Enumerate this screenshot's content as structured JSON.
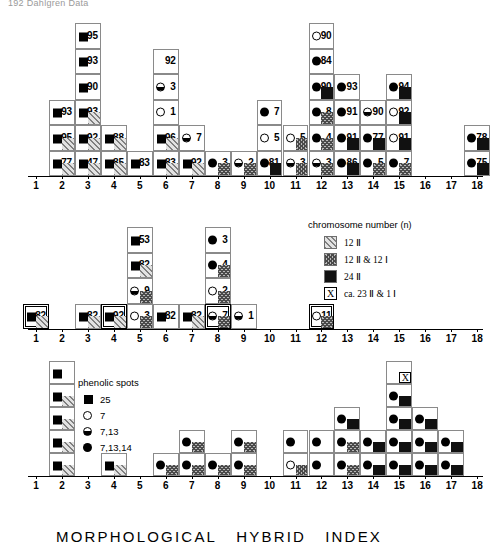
{
  "page": {
    "header": "192  Dahlgren Data"
  },
  "axis": {
    "ticks": [
      1,
      2,
      3,
      4,
      5,
      6,
      7,
      8,
      9,
      10,
      11,
      12,
      13,
      14,
      15,
      16,
      17,
      18
    ],
    "title_parts": [
      "MORPHOLOGICAL",
      "HYBRID",
      "INDEX"
    ]
  },
  "legends": {
    "chromosome": {
      "title": "chromosome   number",
      "title_suffix": "(n)",
      "items": [
        {
          "pattern": "12ii",
          "label": "12 Ⅱ"
        },
        {
          "pattern": "12ii12i",
          "label": "12 Ⅱ & 12 Ⅰ"
        },
        {
          "pattern": "24ii",
          "label": "24 Ⅱ"
        },
        {
          "pattern": "xbox",
          "glyph": "X",
          "label": "ca. 23 Ⅱ & 1 Ⅰ"
        }
      ]
    },
    "phenolic": {
      "title": "phenolic   spots",
      "items": [
        {
          "glyph": "sq",
          "label": "25"
        },
        {
          "glyph": "open",
          "label": "7"
        },
        {
          "glyph": "half",
          "label": "7,13"
        },
        {
          "glyph": "full",
          "label": "7,13,14"
        }
      ]
    }
  },
  "chart_data": [
    {
      "id": "panel-top",
      "type": "bar",
      "title": "",
      "xlabel": "MORPHOLOGICAL HYBRID INDEX",
      "ylabel": "",
      "xlim": [
        1,
        18
      ],
      "grid": false,
      "note": "stacked cell histogram; each cell = one plant, labelled with an accession number, a phenolic-spot glyph and an optional chromosome-number fill patch",
      "categories": [
        1,
        2,
        3,
        4,
        5,
        6,
        7,
        8,
        9,
        10,
        11,
        12,
        13,
        14,
        15,
        16,
        17,
        18
      ],
      "values": [
        0,
        5,
        6,
        2,
        1,
        3,
        2,
        2,
        1,
        2,
        2,
        6,
        4,
        3,
        5,
        0,
        0,
        2
      ],
      "columns": [
        {
          "x": 1,
          "cells": []
        },
        {
          "x": 2,
          "cells": [
            {
              "num": "77",
              "glyph": "sq",
              "chrom": "12ii"
            },
            {
              "num": "95",
              "glyph": "sq",
              "chrom": "12ii"
            },
            {
              "num": "93",
              "glyph": "sq",
              "chrom": ""
            }
          ]
        },
        {
          "x": 3,
          "cells": [
            {
              "num": "47",
              "glyph": "sq",
              "chrom": "12ii"
            },
            {
              "num": "92",
              "glyph": "sq",
              "chrom": "12ii"
            },
            {
              "num": "93",
              "glyph": "sq",
              "chrom": "12ii"
            },
            {
              "num": "90",
              "glyph": "sq",
              "chrom": ""
            },
            {
              "num": "93",
              "glyph": "sq",
              "chrom": ""
            },
            {
              "num": "95",
              "glyph": "sq",
              "chrom": ""
            }
          ]
        },
        {
          "x": 4,
          "cells": [
            {
              "num": "85",
              "glyph": "sq",
              "chrom": "12ii"
            },
            {
              "num": "88",
              "glyph": "sq",
              "chrom": "12ii"
            }
          ]
        },
        {
          "x": 5,
          "cells": [
            {
              "num": "83",
              "glyph": "sq",
              "chrom": ""
            }
          ]
        },
        {
          "x": 6,
          "cells": [
            {
              "num": "83",
              "glyph": "sq",
              "chrom": "12ii"
            },
            {
              "num": "96",
              "glyph": "sq",
              "chrom": "12ii"
            },
            {
              "num": "1",
              "glyph": "open",
              "chrom": ""
            },
            {
              "num": "3",
              "glyph": "half",
              "chrom": ""
            },
            {
              "num": "92",
              "glyph": "",
              "chrom": ""
            }
          ]
        },
        {
          "x": 7,
          "cells": [
            {
              "num": "92",
              "glyph": "sq",
              "chrom": "12ii"
            },
            {
              "num": "7",
              "glyph": "half",
              "chrom": ""
            }
          ]
        },
        {
          "x": 8,
          "cells": [
            {
              "num": "3",
              "glyph": "full",
              "chrom": "12ii12i"
            }
          ]
        },
        {
          "x": 9,
          "cells": [
            {
              "num": "2",
              "glyph": "half",
              "chrom": "12ii12i"
            }
          ]
        },
        {
          "x": 10,
          "cells": [
            {
              "num": "81",
              "glyph": "full",
              "chrom": "24ii"
            },
            {
              "num": "5",
              "glyph": "open",
              "chrom": ""
            },
            {
              "num": "7",
              "glyph": "full",
              "chrom": ""
            }
          ]
        },
        {
          "x": 11,
          "cells": [
            {
              "num": "3",
              "glyph": "half",
              "chrom": "12ii12i"
            },
            {
              "num": "5",
              "glyph": "open",
              "chrom": "12ii12i"
            }
          ]
        },
        {
          "x": 12,
          "cells": [
            {
              "num": "3",
              "glyph": "half",
              "chrom": "12ii12i"
            },
            {
              "num": "4",
              "glyph": "full",
              "chrom": "12ii12i"
            },
            {
              "num": "8",
              "glyph": "full",
              "chrom": "12ii12i"
            },
            {
              "num": "90",
              "glyph": "full",
              "chrom": "24ii"
            },
            {
              "num": "84",
              "glyph": "full",
              "chrom": ""
            },
            {
              "num": "90",
              "glyph": "open",
              "chrom": ""
            }
          ]
        },
        {
          "x": 13,
          "cells": [
            {
              "num": "86",
              "glyph": "full",
              "chrom": "24ii"
            },
            {
              "num": "91",
              "glyph": "full",
              "chrom": "24ii"
            },
            {
              "num": "91",
              "glyph": "full",
              "chrom": ""
            },
            {
              "num": "93",
              "glyph": "full",
              "chrom": ""
            }
          ]
        },
        {
          "x": 14,
          "cells": [
            {
              "num": "5",
              "glyph": "full",
              "chrom": "12ii12i"
            },
            {
              "num": "77",
              "glyph": "full",
              "chrom": "24ii"
            },
            {
              "num": "90",
              "glyph": "half",
              "chrom": ""
            }
          ]
        },
        {
          "x": 15,
          "cells": [
            {
              "num": "7",
              "glyph": "full",
              "chrom": "12ii12i"
            },
            {
              "num": "91",
              "glyph": "open",
              "chrom": "24ii"
            },
            {
              "num": "92",
              "glyph": "open",
              "chrom": "24ii"
            },
            {
              "num": "94",
              "glyph": "full",
              "chrom": "24ii"
            }
          ]
        },
        {
          "x": 16,
          "cells": []
        },
        {
          "x": 17,
          "cells": []
        },
        {
          "x": 18,
          "cells": [
            {
              "num": "75",
              "glyph": "full",
              "chrom": "24ii"
            },
            {
              "num": "78",
              "glyph": "full",
              "chrom": "24ii"
            }
          ]
        }
      ]
    },
    {
      "id": "panel-mid",
      "type": "bar",
      "title": "",
      "xlabel": "MORPHOLOGICAL HYBRID INDEX",
      "ylabel": "",
      "xlim": [
        1,
        18
      ],
      "grid": false,
      "categories": [
        1,
        2,
        3,
        4,
        5,
        6,
        7,
        8,
        9,
        10,
        11,
        12,
        13,
        14,
        15,
        16,
        17,
        18
      ],
      "values": [
        1,
        0,
        1,
        1,
        4,
        1,
        1,
        4,
        1,
        0,
        0,
        1,
        0,
        0,
        0,
        0,
        0,
        0
      ],
      "columns": [
        {
          "x": 1,
          "cells": [
            {
              "num": "82",
              "glyph": "sq",
              "chrom": "12ii",
              "boxed": true
            }
          ]
        },
        {
          "x": 2,
          "cells": []
        },
        {
          "x": 3,
          "cells": [
            {
              "num": "82",
              "glyph": "sq",
              "chrom": "12ii"
            }
          ]
        },
        {
          "x": 4,
          "cells": [
            {
              "num": "92",
              "glyph": "sq",
              "chrom": "12ii",
              "boxed": true
            }
          ]
        },
        {
          "x": 5,
          "cells": [
            {
              "num": "3",
              "glyph": "open",
              "chrom": "12ii12i"
            },
            {
              "num": "9",
              "glyph": "half",
              "chrom": "12ii12i"
            },
            {
              "num": "82",
              "glyph": "sq",
              "chrom": "12ii"
            },
            {
              "num": "53",
              "glyph": "sq",
              "chrom": ""
            }
          ]
        },
        {
          "x": 6,
          "cells": [
            {
              "num": "82",
              "glyph": "sq",
              "chrom": ""
            }
          ]
        },
        {
          "x": 7,
          "cells": [
            {
              "num": "82",
              "glyph": "sq",
              "chrom": "12ii"
            }
          ]
        },
        {
          "x": 8,
          "cells": [
            {
              "num": "7",
              "glyph": "half",
              "chrom": "12ii12i",
              "boxed": true
            },
            {
              "num": "2",
              "glyph": "open",
              "chrom": "12ii12i"
            },
            {
              "num": "4",
              "glyph": "full",
              "chrom": "12ii12i"
            },
            {
              "num": "3",
              "glyph": "full",
              "chrom": ""
            }
          ]
        },
        {
          "x": 9,
          "cells": [
            {
              "num": "1",
              "glyph": "half",
              "chrom": ""
            }
          ]
        },
        {
          "x": 10,
          "cells": []
        },
        {
          "x": 11,
          "cells": []
        },
        {
          "x": 12,
          "cells": [
            {
              "num": "11",
              "glyph": "open",
              "chrom": "12ii12i",
              "boxed": true
            }
          ]
        },
        {
          "x": 13,
          "cells": []
        },
        {
          "x": 14,
          "cells": []
        },
        {
          "x": 15,
          "cells": []
        },
        {
          "x": 16,
          "cells": []
        },
        {
          "x": 17,
          "cells": []
        },
        {
          "x": 18,
          "cells": []
        }
      ]
    },
    {
      "id": "panel-bot",
      "type": "bar",
      "title": "",
      "xlabel": "MORPHOLOGICAL HYBRID INDEX",
      "ylabel": "",
      "xlim": [
        1,
        18
      ],
      "grid": false,
      "note": "unlabelled summary histogram; cells carry only phenolic-spot glyph and chromosome fill",
      "categories": [
        1,
        2,
        3,
        4,
        5,
        6,
        7,
        8,
        9,
        10,
        11,
        12,
        13,
        14,
        15,
        16,
        17,
        18
      ],
      "values": [
        0,
        5,
        0,
        1,
        0,
        1,
        2,
        1,
        2,
        0,
        1,
        1,
        2,
        1,
        4,
        2,
        1,
        0
      ],
      "columns": [
        {
          "x": 1,
          "cells": []
        },
        {
          "x": 2,
          "cells": [
            {
              "glyph": "sq",
              "chrom": "12ii"
            },
            {
              "glyph": "sq",
              "chrom": "12ii"
            },
            {
              "glyph": "sq",
              "chrom": "12ii"
            },
            {
              "glyph": "sq",
              "chrom": "12ii"
            },
            {
              "glyph": "sq",
              "chrom": ""
            }
          ]
        },
        {
          "x": 3,
          "cells": []
        },
        {
          "x": 4,
          "cells": [
            {
              "glyph": "sq",
              "chrom": "12ii"
            }
          ]
        },
        {
          "x": 5,
          "cells": []
        },
        {
          "x": 6,
          "cells": [
            {
              "glyph": "full",
              "chrom": "12ii12i"
            }
          ]
        },
        {
          "x": 7,
          "cells": [
            {
              "glyph": "full",
              "chrom": "12ii12i"
            },
            {
              "glyph": "full",
              "chrom": "12ii12i"
            }
          ]
        },
        {
          "x": 8,
          "cells": [
            {
              "glyph": "full",
              "chrom": "12ii12i"
            }
          ]
        },
        {
          "x": 9,
          "cells": [
            {
              "glyph": "full",
              "chrom": "12ii12i"
            },
            {
              "glyph": "full",
              "chrom": "12ii12i"
            }
          ]
        },
        {
          "x": 10,
          "cells": []
        },
        {
          "x": 11,
          "cells": [
            {
              "glyph": "open",
              "chrom": "12ii12i"
            },
            {
              "glyph": "full",
              "chrom": ""
            }
          ]
        },
        {
          "x": 12,
          "cells": [
            {
              "glyph": "full",
              "chrom": ""
            },
            {
              "glyph": "full",
              "chrom": ""
            }
          ]
        },
        {
          "x": 13,
          "cells": [
            {
              "glyph": "full",
              "chrom": "12ii12i"
            },
            {
              "glyph": "full",
              "chrom": "12ii12i"
            },
            {
              "glyph": "full",
              "chrom": "24ii"
            }
          ]
        },
        {
          "x": 14,
          "cells": [
            {
              "glyph": "full",
              "chrom": "24ii"
            },
            {
              "glyph": "full",
              "chrom": "24ii"
            }
          ]
        },
        {
          "x": 15,
          "cells": [
            {
              "glyph": "full",
              "chrom": "24ii"
            },
            {
              "glyph": "full",
              "chrom": "24ii"
            },
            {
              "glyph": "full",
              "chrom": "24ii"
            },
            {
              "glyph": "full",
              "chrom": "24ii"
            },
            {
              "glyph": "",
              "xmark": "X"
            }
          ]
        },
        {
          "x": 16,
          "cells": [
            {
              "glyph": "full",
              "chrom": "24ii"
            },
            {
              "glyph": "full",
              "chrom": "24ii"
            },
            {
              "glyph": "full",
              "chrom": "24ii"
            }
          ]
        },
        {
          "x": 17,
          "cells": [
            {
              "glyph": "full",
              "chrom": "24ii"
            },
            {
              "glyph": "full",
              "chrom": "24ii"
            }
          ]
        },
        {
          "x": 18,
          "cells": []
        }
      ]
    }
  ]
}
